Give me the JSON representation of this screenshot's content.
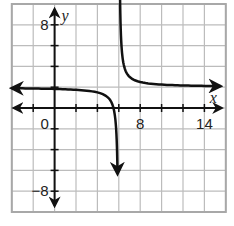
{
  "chart_data": {
    "type": "line",
    "title": "",
    "function": "y = 1/(x - 6) + 2",
    "xlabel": "x",
    "ylabel": "y",
    "xlim": [
      -4,
      16
    ],
    "ylim": [
      -10,
      10
    ],
    "grid": true,
    "grid_step": 2,
    "x_tick_labels": [
      {
        "value": 0,
        "label": "0"
      },
      {
        "value": 8,
        "label": "8"
      },
      {
        "value": 14,
        "label": "14"
      }
    ],
    "y_tick_labels": [
      {
        "value": 8,
        "label": "8"
      },
      {
        "value": -8,
        "label": "−8"
      }
    ],
    "asymptotes": {
      "vertical": 6,
      "horizontal": 2
    },
    "series": [
      {
        "name": "left-branch",
        "x_range": [
          -4,
          5.88
        ]
      },
      {
        "name": "right-branch",
        "x_range": [
          6.1,
          15.6
        ]
      }
    ],
    "sample_points": [
      {
        "x": -4,
        "y": 1.9
      },
      {
        "x": 0,
        "y": 1.83
      },
      {
        "x": 4,
        "y": 1.5
      },
      {
        "x": 5,
        "y": 1
      },
      {
        "x": 7,
        "y": 3
      },
      {
        "x": 8,
        "y": 2.5
      },
      {
        "x": 14,
        "y": 2.13
      }
    ]
  },
  "colors": {
    "grid": "#bcbcbc",
    "border": "#a8a8a8",
    "axis": "#111111",
    "curve": "#111111",
    "background": "#ffffff"
  }
}
